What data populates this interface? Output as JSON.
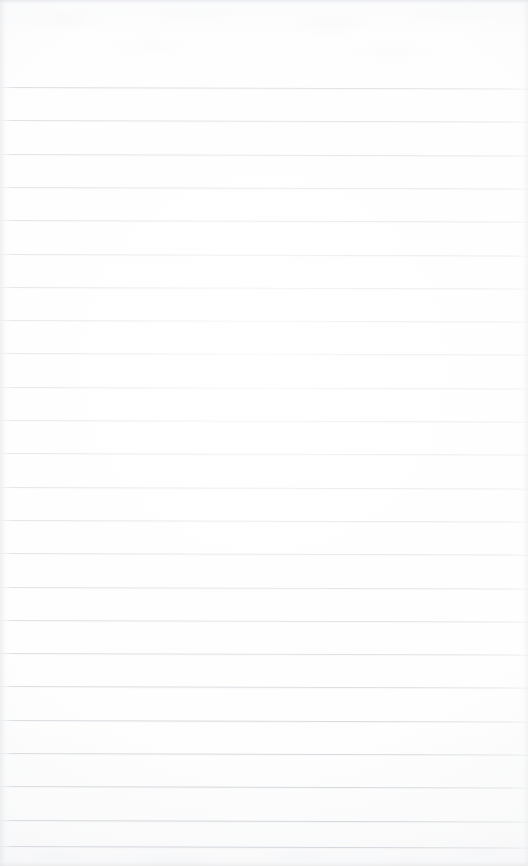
{
  "document": {
    "type": "scanned-lined-paper",
    "title": "Blank ruled notepad page",
    "orientation": "portrait",
    "width_px": 528,
    "height_px": 866,
    "content_text": "",
    "has_handwriting": false,
    "has_printed_text": false,
    "has_margin_rule": false,
    "has_header": false,
    "has_page_number": false
  },
  "paper": {
    "background_color": "#fdfdfd",
    "top_tint_color": "#f7f8f9",
    "bottom_tint_color": "#f9f9fa",
    "texture": "faint mottled scanner show-through at top and bottom edges",
    "vignette": "soft light falloff toward corners"
  },
  "ruling": {
    "line_color": "#a3aab5",
    "line_weight_px": 1,
    "line_spacing_px": 33.3,
    "first_line_y_px": 87,
    "line_count": 24,
    "skew_deg": 0.18,
    "skew_note": "lines slope very slightly downward toward the right",
    "extends_full_width": true,
    "left_fade_px": 14,
    "right_fade_pct": 96,
    "lines_y": [
      87,
      120.3,
      153.6,
      186.9,
      220.2,
      253.5,
      286.8,
      320.1,
      353.4,
      386.7,
      420,
      453.3,
      486.6,
      519.9,
      553.2,
      586.5,
      619.8,
      653.1,
      686.4,
      719.7,
      753,
      786.3,
      819.6,
      845.5
    ]
  },
  "regions": {
    "top_blank_band": {
      "label": "unruled top margin",
      "y_start_px": 0,
      "y_end_px": 87,
      "height_px": 87
    },
    "ruled_body": {
      "label": "ruled writing body",
      "y_start_px": 87,
      "y_end_px": 846,
      "height_px": 759
    },
    "bottom_blank_band": {
      "label": "unruled bottom margin",
      "y_start_px": 846,
      "y_end_px": 866,
      "height_px": 20
    }
  }
}
